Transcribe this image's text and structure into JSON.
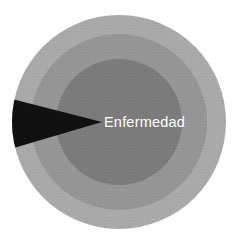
{
  "figure": {
    "type": "concentric-circles-with-wedge",
    "background_color": "#ffffff",
    "width": 238,
    "height": 245,
    "center": {
      "x": 119,
      "y": 122
    }
  },
  "rings": [
    {
      "name": "outer-ring",
      "label": "",
      "color": "#a9a9a9",
      "radius": 107
    },
    {
      "name": "middle-ring",
      "label": "",
      "color": "#959595",
      "radius": 88
    },
    {
      "name": "inner-circle",
      "label": "Enfermedad",
      "color": "#7b7b7b",
      "radius": 63
    }
  ],
  "wedge": {
    "name": "wedge",
    "label": "",
    "color": "#111111",
    "apex": {
      "x": 102,
      "y": 122
    },
    "base_x": 0,
    "base_top_y": 96,
    "base_bottom_y": 152
  },
  "labels": {
    "inner_label": "Enfermedad",
    "inner_label_color": "#ffffff",
    "inner_label_x": 104,
    "inner_label_y": 127
  }
}
